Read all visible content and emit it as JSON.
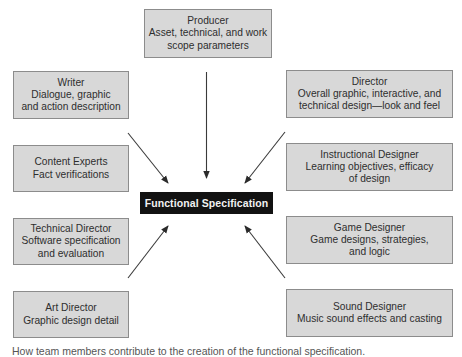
{
  "diagram": {
    "center": {
      "label": "Functional Specification"
    },
    "roles": [
      {
        "id": "producer",
        "title": "Producer",
        "desc": [
          "Asset, technical, and work",
          "scope parameters"
        ]
      },
      {
        "id": "writer",
        "title": "Writer",
        "desc": [
          "Dialogue, graphic",
          "and action description"
        ]
      },
      {
        "id": "content-experts",
        "title": "Content Experts",
        "desc": [
          "Fact verifications"
        ]
      },
      {
        "id": "technical-director",
        "title": "Technical Director",
        "desc": [
          "Software specification",
          "and evaluation"
        ]
      },
      {
        "id": "art-director",
        "title": "Art Director",
        "desc": [
          "Graphic design detail"
        ]
      },
      {
        "id": "director",
        "title": "Director",
        "desc": [
          "Overall graphic, interactive, and",
          "technical design—look and feel"
        ]
      },
      {
        "id": "instructional-designer",
        "title": "Instructional Designer",
        "desc": [
          "Learning objectives, efficacy",
          "of design"
        ]
      },
      {
        "id": "game-designer",
        "title": "Game Designer",
        "desc": [
          "Game designs, strategies,",
          "and logic"
        ]
      },
      {
        "id": "sound-designer",
        "title": "Sound Designer",
        "desc": [
          "Music sound effects and casting"
        ]
      }
    ],
    "arrows": [
      {
        "from": "producer",
        "to": "center"
      },
      {
        "from": "writer",
        "to": "center"
      },
      {
        "from": "director",
        "to": "center"
      },
      {
        "from": "technical-director",
        "to": "center"
      },
      {
        "from": "game-designer",
        "to": "center"
      }
    ],
    "caption": "How team members contribute to the creation of the functional specification."
  },
  "colors": {
    "box_fill": "#d8d8d8",
    "box_border": "#8c8c8c",
    "center_fill": "#121212",
    "center_text": "#f2f2f2",
    "arrow": "#333333"
  }
}
